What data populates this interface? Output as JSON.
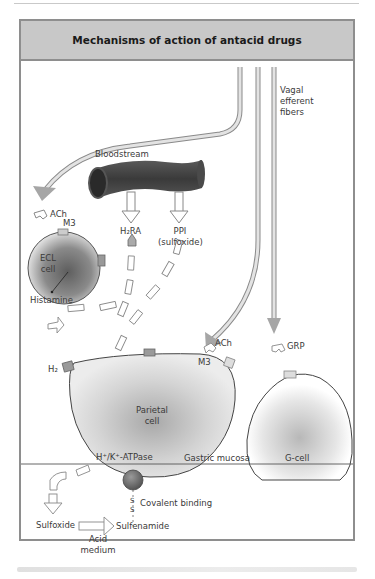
{
  "figure": {
    "title": "Mechanisms of action of antacid drugs",
    "caption_visible_text": ""
  },
  "labels": {
    "vagal": [
      "Vagal",
      "efferent",
      "fibers"
    ],
    "bloodstream": "Bloodstream",
    "ach_top": "ACh",
    "m3_ecl": "M3",
    "ecl_cell": [
      "ECL",
      "cell"
    ],
    "h2ra": "H₂RA",
    "ppi": [
      "PPI",
      "(sulfoxide)"
    ],
    "histamine": "Histamine",
    "h2": "H₂",
    "ach_mid": "ACh",
    "m3_parietal": "M3",
    "grp": "GRP",
    "parietal_cell": [
      "Parietal",
      "cell"
    ],
    "atpase": "H⁺/K⁺-ATPase",
    "gastric_mucosa": "Gastric mucosa",
    "g_cell": "G-cell",
    "covalent_binding": "Covalent binding",
    "sulfoxide": "Sulfoxide",
    "sulfenamide": "Sulfenamide",
    "acid_medium": [
      "Acid",
      "medium"
    ],
    "disulfide": [
      "S",
      "S"
    ]
  },
  "colors": {
    "frame": "#8e8e8e",
    "title_band": "#c8c8c8",
    "vessel": "#4a4a4a",
    "arrow_dark": "#9a9a9a",
    "arrow_light": "#e6e6e6",
    "cell_core": "#6e6e6e",
    "cell_fill": "#e4e4e4"
  }
}
